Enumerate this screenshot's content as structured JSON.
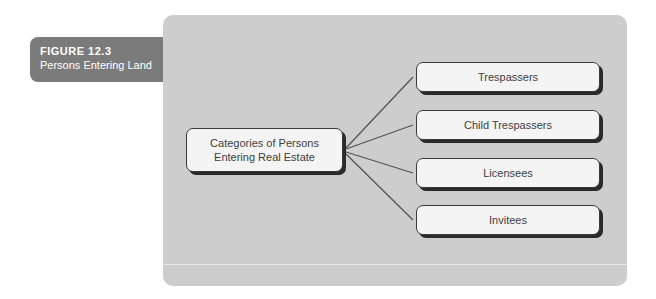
{
  "figure": {
    "number": "FIGURE 12.3",
    "title": "Persons Entering Land"
  },
  "diagram": {
    "root": {
      "line1": "Categories of Persons",
      "line2": "Entering Real Estate"
    },
    "children": [
      {
        "label": "Trespassers"
      },
      {
        "label": "Child Trespassers"
      },
      {
        "label": "Licensees"
      },
      {
        "label": "Invitees"
      }
    ]
  },
  "colors": {
    "panel": "#cdcdcd",
    "label_tab": "#7b7b7b",
    "node_fill": "#f4f4f4",
    "node_border": "#3a3a3a",
    "connector": "#555555"
  }
}
